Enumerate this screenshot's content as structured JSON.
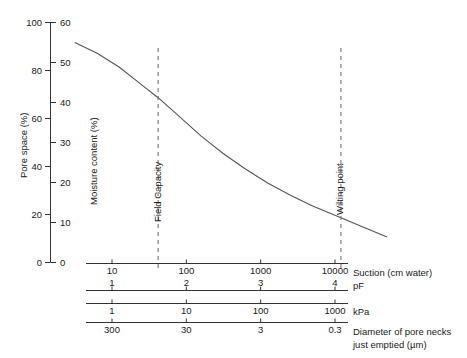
{
  "chart_data": {
    "type": "line",
    "title": "",
    "xlabel": "Suction (cm water)",
    "ylabel": "Pore space (%)",
    "ylabel_secondary": "Moisture content (%)",
    "grid": false,
    "legend": "none",
    "x_log": true,
    "xlim_log10": [
      0.5,
      4.7
    ],
    "ylim_pore_space": [
      0,
      100
    ],
    "ylim_moisture": [
      0,
      60
    ],
    "y_axis_primary": {
      "name": "Pore space (%)",
      "ticks": [
        0,
        20,
        40,
        60,
        80,
        100
      ]
    },
    "y_axis_secondary": {
      "name": "Moisture content (%)",
      "ticks": [
        0,
        10,
        20,
        30,
        40,
        50,
        60
      ]
    },
    "x_axes": [
      {
        "name": "Suction (cm water)",
        "label": "Suction (cm water)",
        "ticks": [
          "10",
          "100",
          "1000",
          "10000"
        ],
        "tick_log10": [
          1,
          2,
          3,
          4
        ],
        "labels_below": true
      },
      {
        "name": "pF",
        "label": "pF",
        "ticks": [
          "1",
          "2",
          "3",
          "4"
        ],
        "tick_log10": [
          1,
          2,
          3,
          4
        ],
        "labels_below": false
      },
      {
        "name": "kPa",
        "label": "kPa",
        "ticks": [
          "1",
          "10",
          "100",
          "1000"
        ],
        "tick_log10": [
          1,
          2,
          3,
          4
        ],
        "labels_below": true
      },
      {
        "name": "pore-neck-diameter",
        "label": "Diameter of pore necks",
        "label_line2": "just emptied (µm)",
        "ticks": [
          "300",
          "30",
          "3",
          "0.3"
        ],
        "tick_log10": [
          1,
          2,
          3,
          4
        ],
        "labels_below": true
      }
    ],
    "reference_lines": [
      {
        "name": "Field Capacity",
        "label": "Field Capacity",
        "x_log10": 1.62,
        "moisture_at_line": 38
      },
      {
        "name": "Wilting point",
        "label": "Wilting point",
        "x_log10": 4.08,
        "moisture_at_line": 10
      }
    ],
    "series": [
      {
        "name": "Water retention curve",
        "x_log10": [
          0.5,
          0.8,
          1.1,
          1.4,
          1.62,
          1.9,
          2.2,
          2.5,
          2.8,
          3.1,
          3.4,
          3.7,
          4.08,
          4.4,
          4.7
        ],
        "moisture_content": [
          55.0,
          52.3,
          48.8,
          44.4,
          41.2,
          36.6,
          31.6,
          27.2,
          23.3,
          19.8,
          16.8,
          14.1,
          11.2,
          8.7,
          6.4
        ],
        "pore_space": [
          91.7,
          87.2,
          81.3,
          74.0,
          68.7,
          61.0,
          52.7,
          45.3,
          38.8,
          33.0,
          28.0,
          23.5,
          18.7,
          14.5,
          10.7
        ]
      }
    ]
  },
  "style": {
    "curve_color": "#555555",
    "axis_color": "#333333",
    "dash_color": "#666666",
    "background": "#ffffff"
  }
}
